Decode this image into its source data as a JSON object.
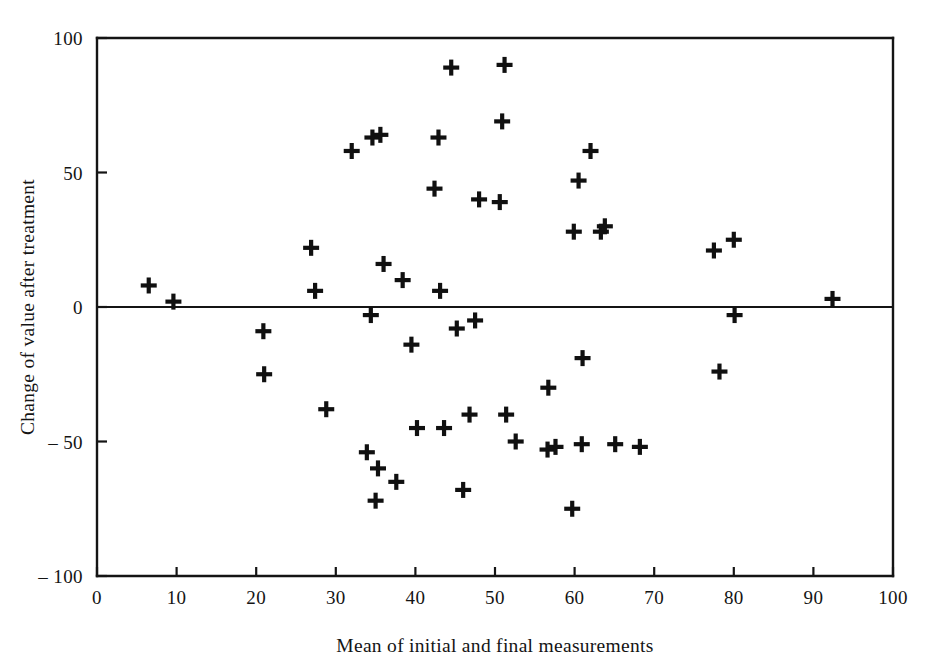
{
  "chart_data": {
    "type": "scatter",
    "title": "",
    "xlabel": "Mean of initial and final measurements",
    "ylabel": "Change of value after treatment",
    "xlim": [
      0,
      100
    ],
    "ylim": [
      -100,
      100
    ],
    "xticks": [
      0,
      10,
      20,
      30,
      40,
      50,
      60,
      70,
      80,
      90,
      100
    ],
    "yticks": [
      -100,
      -50,
      0,
      50,
      100
    ],
    "xtick_labels": [
      "0",
      "10",
      "20",
      "30",
      "40",
      "50",
      "60",
      "70",
      "80",
      "90",
      "100"
    ],
    "ytick_labels": [
      "– 100",
      "– 50",
      "0",
      "50",
      "100"
    ],
    "grid": false,
    "legend": null,
    "marker": "plus",
    "marker_color": "#101010",
    "reference_lines": [
      {
        "name": "zero-line",
        "orientation": "horizontal",
        "value": 0
      }
    ],
    "points": [
      {
        "x": 6.5,
        "y": 8
      },
      {
        "x": 9.6,
        "y": 2
      },
      {
        "x": 20.9,
        "y": -9
      },
      {
        "x": 21.0,
        "y": -25
      },
      {
        "x": 26.9,
        "y": 22
      },
      {
        "x": 27.4,
        "y": 6
      },
      {
        "x": 28.8,
        "y": -38
      },
      {
        "x": 32.0,
        "y": 58
      },
      {
        "x": 34.6,
        "y": 63
      },
      {
        "x": 35.6,
        "y": 64
      },
      {
        "x": 34.4,
        "y": -3
      },
      {
        "x": 36.0,
        "y": 16
      },
      {
        "x": 33.9,
        "y": -54
      },
      {
        "x": 35.3,
        "y": -60
      },
      {
        "x": 35.0,
        "y": -72
      },
      {
        "x": 37.6,
        "y": -65
      },
      {
        "x": 38.4,
        "y": 10
      },
      {
        "x": 39.5,
        "y": -14
      },
      {
        "x": 40.2,
        "y": -45
      },
      {
        "x": 42.4,
        "y": 44
      },
      {
        "x": 42.9,
        "y": 63
      },
      {
        "x": 43.1,
        "y": 6
      },
      {
        "x": 43.6,
        "y": -45
      },
      {
        "x": 44.5,
        "y": 89
      },
      {
        "x": 45.2,
        "y": -8
      },
      {
        "x": 46.0,
        "y": -68
      },
      {
        "x": 46.8,
        "y": -40
      },
      {
        "x": 47.5,
        "y": -5
      },
      {
        "x": 48.0,
        "y": 40
      },
      {
        "x": 50.6,
        "y": 39
      },
      {
        "x": 50.9,
        "y": 69
      },
      {
        "x": 51.2,
        "y": 90
      },
      {
        "x": 51.4,
        "y": -40
      },
      {
        "x": 52.6,
        "y": -50
      },
      {
        "x": 56.7,
        "y": -30
      },
      {
        "x": 56.6,
        "y": -53
      },
      {
        "x": 57.6,
        "y": -52
      },
      {
        "x": 59.7,
        "y": -75
      },
      {
        "x": 59.9,
        "y": 28
      },
      {
        "x": 60.5,
        "y": 47
      },
      {
        "x": 61.0,
        "y": -19
      },
      {
        "x": 60.9,
        "y": -51
      },
      {
        "x": 62.0,
        "y": 58
      },
      {
        "x": 63.3,
        "y": 28
      },
      {
        "x": 63.8,
        "y": 30
      },
      {
        "x": 65.1,
        "y": -51
      },
      {
        "x": 68.2,
        "y": -52
      },
      {
        "x": 77.5,
        "y": 21
      },
      {
        "x": 78.2,
        "y": -24
      },
      {
        "x": 80.0,
        "y": 25
      },
      {
        "x": 80.1,
        "y": -3
      },
      {
        "x": 92.4,
        "y": 3
      }
    ]
  },
  "axis": {
    "y_title": "Change of value after treatment",
    "x_title": "Mean of initial and final measurements"
  }
}
